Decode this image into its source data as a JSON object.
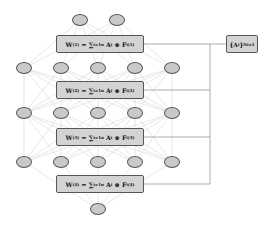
{
  "diagram": {
    "type": "neural-network-weight-decomposition",
    "layers": [
      {
        "name": "layer-0",
        "node_count": 2,
        "y": 20,
        "x": [
          80,
          117
        ]
      },
      {
        "name": "layer-1",
        "node_count": 5,
        "y": 68,
        "x": [
          24,
          61,
          98,
          135,
          172
        ]
      },
      {
        "name": "layer-2",
        "node_count": 5,
        "y": 113,
        "x": [
          24,
          61,
          98,
          135,
          172
        ]
      },
      {
        "name": "layer-3",
        "node_count": 5,
        "y": 162,
        "x": [
          24,
          61,
          98,
          135,
          172
        ]
      },
      {
        "name": "layer-4",
        "node_count": 1,
        "y": 209,
        "x": [
          98
        ]
      }
    ],
    "weight_boxes": [
      {
        "label": "W(1) = Σ_{i=1}^{n} A_i ⊗ F_i^(1)",
        "w": "W",
        "w_sup": "(1)",
        "sum": "∑",
        "sum_sup": "n",
        "sum_sub": "i=1",
        "a": "A",
        "a_sub": "i",
        "op": "⊗",
        "f": "F",
        "f_sup": "(1)",
        "f_sub": "i",
        "y": 35
      },
      {
        "label": "W(2) = Σ_{i=1}^{n} A_i ⊗ F_i^(2)",
        "w": "W",
        "w_sup": "(2)",
        "sum": "∑",
        "sum_sup": "n",
        "sum_sub": "i=1",
        "a": "A",
        "a_sub": "i",
        "op": "⊗",
        "f": "F",
        "f_sup": "(2)",
        "f_sub": "i",
        "y": 81
      },
      {
        "label": "W(3) = Σ_{i=1}^{n} A_i ⊗ F_i^(3)",
        "w": "W",
        "w_sup": "(3)",
        "sum": "∑",
        "sum_sup": "n",
        "sum_sub": "i=1",
        "a": "A",
        "a_sub": "i",
        "op": "⊗",
        "f": "F",
        "f_sup": "(3)",
        "f_sub": "i",
        "y": 128
      },
      {
        "label": "W(4) = Σ_{i=1}^{n} A_i ⊗ F_i^(4)",
        "w": "W",
        "w_sup": "(4)",
        "sum": "∑",
        "sum_sup": "n",
        "sum_sub": "i=1",
        "a": "A",
        "a_sub": "i",
        "op": "⊗",
        "f": "F",
        "f_sup": "(4)",
        "f_sub": "i",
        "y": 175
      }
    ],
    "shared_box": {
      "label": "{A_i}_{i=1}^{N}",
      "open": "{A",
      "sub_i": "i",
      "close": "}",
      "sup": "N",
      "sub": "i=1"
    },
    "colors": {
      "node_fill": "#c9c9c9",
      "box_fill": "#d3d3d3",
      "stroke": "#555555",
      "edge": "#d0d0d0",
      "connector": "#888888"
    }
  }
}
